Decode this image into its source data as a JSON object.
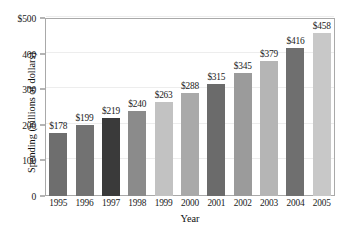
{
  "chart_data": {
    "type": "bar",
    "title": "",
    "xlabel": "Year",
    "ylabel": "Spending (billions of dollars)",
    "categories": [
      "1995",
      "1996",
      "1997",
      "1998",
      "1999",
      "2000",
      "2001",
      "2002",
      "2003",
      "2004",
      "2005"
    ],
    "values": [
      178,
      199,
      219,
      240,
      263,
      288,
      315,
      345,
      379,
      416,
      458
    ],
    "data_labels": [
      "$178",
      "$199",
      "$219",
      "$240",
      "$263",
      "$288",
      "$315",
      "$345",
      "$379",
      "$416",
      "$458"
    ],
    "bar_colors": [
      "#6e6e6e",
      "#727272",
      "#3a3a3a",
      "#8b8b8b",
      "#c2c2c2",
      "#a9a9a9",
      "#6b6b6b",
      "#9b9b9b",
      "#b5b5b5",
      "#6f6f6f",
      "#c8c8c8"
    ],
    "ylim": [
      0,
      500
    ],
    "ytick_values": [
      0,
      100,
      200,
      300,
      400,
      500
    ],
    "ytick_labels": [
      "0",
      "100",
      "200",
      "300",
      "400",
      "$500"
    ],
    "grid": true,
    "grid_axis": "y",
    "legend": "none"
  },
  "axes": {
    "y_title": "Spending (billions of dollars)",
    "x_title": "Year"
  }
}
